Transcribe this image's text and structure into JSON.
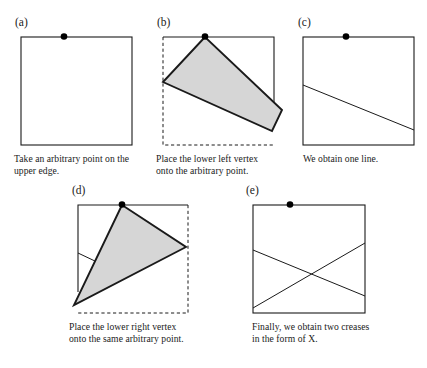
{
  "figure": {
    "background_color": "#ffffff",
    "stroke_color": "#1a1a1a",
    "fold_fill_color": "#d6d6d6",
    "dot_color": "#000000",
    "panels": [
      {
        "id": "a",
        "label": "(a)",
        "caption_lines": [
          "Take an arbitrary point on the",
          "upper edge."
        ],
        "square": {
          "x": 21,
          "y": 37,
          "w": 111,
          "h": 108
        },
        "dot": {
          "x": 64,
          "y": 36,
          "r": 3.2
        },
        "solid_edges": [
          "top",
          "left",
          "right",
          "bottom"
        ],
        "dashed_edges": [],
        "creases": [],
        "fold_polygon": []
      },
      {
        "id": "b",
        "label": "(b)",
        "caption_lines": [
          "Place the lower left vertex",
          "onto the arbitrary point."
        ],
        "square": {
          "x": 163,
          "y": 37,
          "w": 111,
          "h": 108
        },
        "dot": {
          "x": 205,
          "y": 36,
          "r": 3.2
        },
        "solid_edges": [
          "top",
          "right_upper"
        ],
        "dashed_edges": [
          "left",
          "bottom"
        ],
        "creases": [],
        "fold_polygon": [
          [
            205,
            37
          ],
          [
            163,
            82
          ],
          [
            282,
            110
          ],
          [
            272,
            131
          ]
        ]
      },
      {
        "id": "c",
        "label": "(c)",
        "caption_lines": [
          "We obtain one line."
        ],
        "square": {
          "x": 303,
          "y": 37,
          "w": 111,
          "h": 108
        },
        "dot": {
          "x": 346,
          "y": 36,
          "r": 3.2
        },
        "solid_edges": [
          "top",
          "left",
          "right",
          "bottom"
        ],
        "dashed_edges": [],
        "creases": [
          [
            303,
            85,
            414,
            130
          ]
        ],
        "fold_polygon": []
      },
      {
        "id": "d",
        "label": "(d)",
        "caption_lines": [
          "Place the lower right vertex",
          "onto the same arbitrary point."
        ],
        "square": {
          "x": 78,
          "y": 205,
          "w": 110,
          "h": 108
        },
        "dot": {
          "x": 122,
          "y": 204,
          "r": 3.2
        },
        "solid_edges": [
          "top",
          "left_upper"
        ],
        "dashed_edges": [
          "right",
          "bottom"
        ],
        "creases": [
          [
            78,
            253,
            97,
            262
          ]
        ],
        "fold_polygon": [
          [
            122,
            205
          ],
          [
            186,
            247
          ],
          [
            74,
            305
          ]
        ]
      },
      {
        "id": "e",
        "label": "(e)",
        "caption_lines": [
          "Finally, we obtain two creases",
          "in the form of X."
        ],
        "square": {
          "x": 253,
          "y": 205,
          "w": 112,
          "h": 108
        },
        "dot": {
          "x": 290,
          "y": 204,
          "r": 3.2
        },
        "solid_edges": [
          "top",
          "left",
          "right",
          "bottom"
        ],
        "dashed_edges": [],
        "creases": [
          [
            253,
            250,
            365,
            296
          ],
          [
            253,
            308,
            365,
            243
          ]
        ],
        "fold_polygon": []
      }
    ],
    "labels": {
      "a": "(a)",
      "b": "(b)",
      "c": "(c)",
      "d": "(d)",
      "e": "(e)"
    },
    "captions": {
      "a_line1": "Take an arbitrary point on the",
      "a_line2": "upper edge.",
      "b_line1": "Place the lower left vertex",
      "b_line2": "onto the arbitrary point.",
      "c_line1": "We obtain one line.",
      "d_line1": "Place the lower right vertex",
      "d_line2": "onto the same arbitrary point.",
      "e_line1": "Finally, we obtain two creases",
      "e_line2": "in the form of X."
    }
  }
}
